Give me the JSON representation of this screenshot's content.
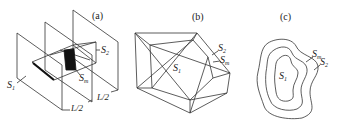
{
  "figure": {
    "panels": [
      {
        "id": "a",
        "tag": "(a)",
        "labels": {
          "s1": {
            "base": "S",
            "sub": "1"
          },
          "s2": {
            "base": "S",
            "sub": "2"
          },
          "sm": {
            "base": "S",
            "sub": "m"
          },
          "dim1": "L/2",
          "dim2": "L/2"
        }
      },
      {
        "id": "b",
        "tag": "(b)",
        "labels": {
          "s1": {
            "base": "S",
            "sub": "1"
          },
          "s2": {
            "base": "S",
            "sub": "2"
          },
          "sm": {
            "base": "S",
            "sub": "m"
          }
        }
      },
      {
        "id": "c",
        "tag": "(c)",
        "labels": {
          "s1": {
            "base": "S",
            "sub": "1"
          },
          "s2": {
            "base": "S",
            "sub": "2"
          },
          "sm": {
            "base": "S",
            "sub": "m"
          }
        }
      }
    ],
    "colors": {
      "line": "#333333",
      "fill_dark": "#111111",
      "background": "#ffffff"
    }
  }
}
